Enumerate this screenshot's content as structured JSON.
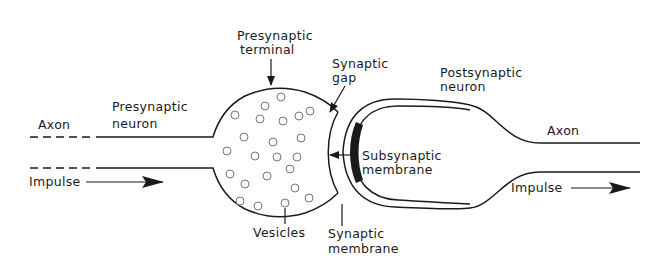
{
  "diagram": {
    "type": "synapse-anatomy",
    "labels": {
      "presynaptic_terminal": [
        "Presynaptic",
        "terminal"
      ],
      "synaptic_gap": [
        "Synaptic",
        "gap"
      ],
      "postsynaptic_neuron": [
        "Postsynaptic",
        "neuron"
      ],
      "presynaptic_neuron": [
        "Presynaptic",
        "neuron"
      ],
      "axon_left": "Axon",
      "axon_right": "Axon",
      "impulse_left": "Impulse",
      "impulse_right": "Impulse",
      "subsynaptic_membrane": [
        "Subsynaptic",
        "membrane"
      ],
      "synaptic_membrane": [
        "Synaptic",
        "membrane"
      ],
      "vesicles": "Vesicles"
    },
    "colors": {
      "ink": "#1a1a1a",
      "vesicle": "#777777",
      "background": "#ffffff"
    }
  }
}
